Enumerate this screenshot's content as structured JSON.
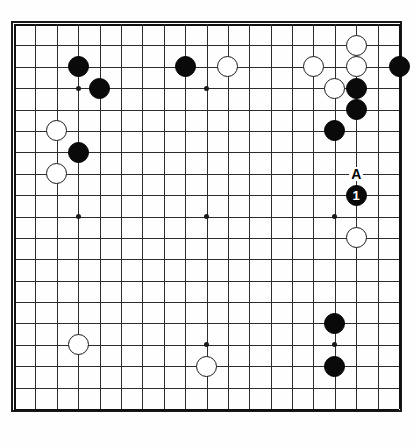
{
  "diagram": {
    "kind": "go-board-diagram",
    "board_size": 19,
    "geometry": {
      "origin_x": 14,
      "origin_y": 24,
      "cell": 21.39,
      "stone_radius": 10.5,
      "hoshi_radius": 2.5
    },
    "colors": {
      "background": "#ffffff",
      "grid": "#2b2b2b",
      "border": "#1a1a1a",
      "black_stone": "#0a0a0a",
      "white_stone": "#ffffff",
      "white_stone_edge": "#1a1a1a",
      "label_text": "#000000",
      "stone_number_text": "#ffffff"
    },
    "hoshi": [
      {
        "col": 3,
        "row": 3
      },
      {
        "col": 9,
        "row": 3
      },
      {
        "col": 15,
        "row": 3
      },
      {
        "col": 3,
        "row": 9
      },
      {
        "col": 9,
        "row": 9
      },
      {
        "col": 15,
        "row": 9
      },
      {
        "col": 3,
        "row": 15
      },
      {
        "col": 9,
        "row": 15
      },
      {
        "col": 15,
        "row": 15
      }
    ],
    "stones": [
      {
        "col": 3,
        "row": 2,
        "color": "black",
        "label": ""
      },
      {
        "col": 4,
        "row": 3,
        "color": "black",
        "label": ""
      },
      {
        "col": 2,
        "row": 5,
        "color": "white",
        "label": ""
      },
      {
        "col": 3,
        "row": 6,
        "color": "black",
        "label": ""
      },
      {
        "col": 2,
        "row": 7,
        "color": "white",
        "label": ""
      },
      {
        "col": 8,
        "row": 2,
        "color": "black",
        "label": ""
      },
      {
        "col": 10,
        "row": 2,
        "color": "white",
        "label": ""
      },
      {
        "col": 16,
        "row": 1,
        "color": "white",
        "label": ""
      },
      {
        "col": 14,
        "row": 2,
        "color": "white",
        "label": ""
      },
      {
        "col": 16,
        "row": 2,
        "color": "white",
        "label": ""
      },
      {
        "col": 18,
        "row": 2,
        "color": "black",
        "label": ""
      },
      {
        "col": 15,
        "row": 3,
        "color": "white",
        "label": ""
      },
      {
        "col": 16,
        "row": 3,
        "color": "black",
        "label": ""
      },
      {
        "col": 16,
        "row": 4,
        "color": "black",
        "label": ""
      },
      {
        "col": 15,
        "row": 5,
        "color": "black",
        "label": ""
      },
      {
        "col": 16,
        "row": 8,
        "color": "black",
        "label": "1"
      },
      {
        "col": 16,
        "row": 10,
        "color": "white",
        "label": ""
      },
      {
        "col": 15,
        "row": 14,
        "color": "black",
        "label": ""
      },
      {
        "col": 3,
        "row": 15,
        "color": "white",
        "label": ""
      },
      {
        "col": 15,
        "row": 16,
        "color": "black",
        "label": ""
      },
      {
        "col": 9,
        "row": 16,
        "color": "white",
        "label": ""
      }
    ],
    "point_labels": [
      {
        "col": 16,
        "row": 7,
        "text": "A"
      }
    ]
  }
}
